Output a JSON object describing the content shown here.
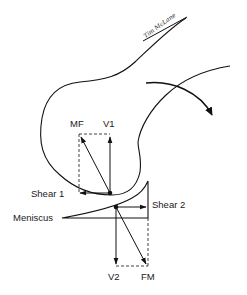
{
  "diagram": {
    "signature": "Tim McLane",
    "labels": {
      "mf": "MF",
      "v1": "V1",
      "shear1": "Shear 1",
      "shear2": "Shear 2",
      "meniscus": "Meniscus",
      "v2": "V2",
      "fm": "FM"
    },
    "colors": {
      "stroke": "#111111",
      "background": "#ffffff"
    }
  }
}
